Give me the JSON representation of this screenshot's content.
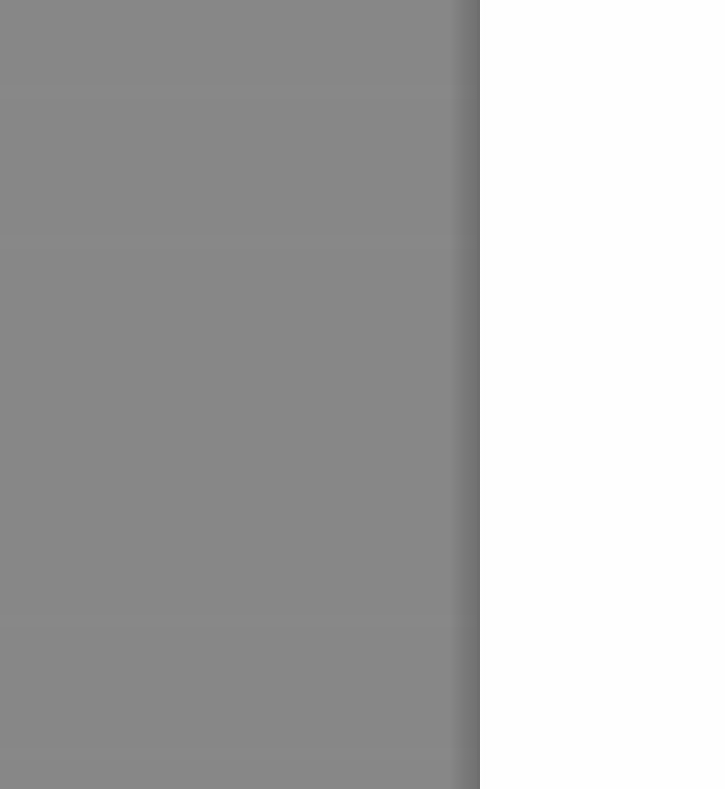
{
  "screen": {
    "width": 725,
    "height": 789,
    "background_color": "#fefefe"
  },
  "overlay": {
    "state": "open",
    "scrim": {
      "color": "#878787",
      "x": 0,
      "y": 0,
      "width": 477,
      "height": 789
    },
    "edge": {
      "color": "#6e6e6e",
      "x": 477,
      "width": 3
    },
    "shadow": {
      "x": 449,
      "width": 28,
      "color": "#000000"
    }
  },
  "drawer": {
    "background_color": "#fefefe",
    "x": 480,
    "y": 0,
    "width": 245,
    "height": 789,
    "content": ""
  },
  "underlay": {
    "background_color": "#f4f4f4",
    "content": ""
  }
}
